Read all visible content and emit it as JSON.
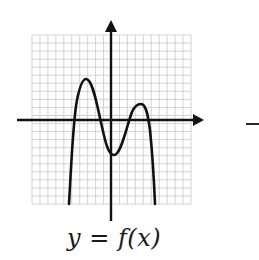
{
  "figure": {
    "caption": "y = f(x)",
    "trailing_mark": "–",
    "colors": {
      "grid": "#c8c8c8",
      "axis": "#111111",
      "curve": "#111111",
      "background": "#ffffff"
    }
  },
  "chart_data": {
    "type": "line",
    "title": "",
    "caption": "y = f(x)",
    "xlabel": "",
    "ylabel": "",
    "grid": true,
    "axes_arrows": [
      "x-positive",
      "y-positive"
    ],
    "grid_cells": {
      "x": 20,
      "y": 21
    },
    "xlim": [
      -10,
      10
    ],
    "ylim": [
      -10.5,
      10.5
    ],
    "key_points": {
      "x_intercepts": [
        -4.5,
        -1.75,
        2.1,
        4.75
      ],
      "local_max_left": [
        -3.25,
        5.1
      ],
      "local_min": [
        0.4,
        -4.4
      ],
      "local_max_right": [
        3.75,
        2.0
      ],
      "left_branch_end": [
        -5.25,
        -10.5
      ],
      "right_branch_end": [
        5.5,
        -10.5
      ]
    },
    "x": [
      -5.25,
      -4.5,
      -3.25,
      -1.75,
      0.4,
      2.1,
      3.75,
      4.75,
      5.5
    ],
    "series": [
      {
        "name": "f(x)",
        "values": [
          -10.5,
          0,
          5.1,
          0,
          -4.4,
          0,
          2.0,
          0,
          -10.5
        ]
      }
    ]
  }
}
